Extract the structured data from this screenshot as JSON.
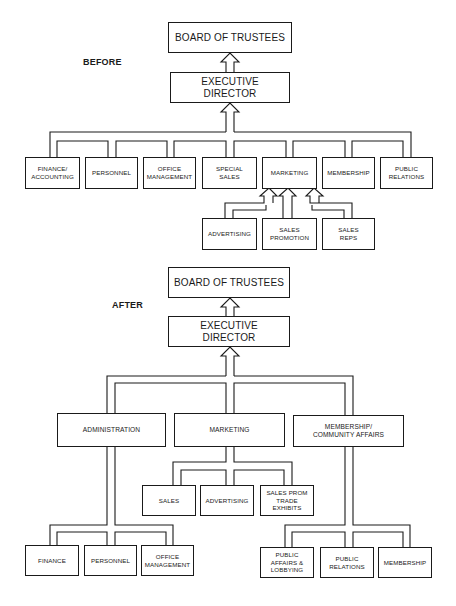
{
  "before": {
    "label": "BEFORE",
    "board": "BOARD OF TRUSTEES",
    "executive": "EXECUTIVE\nDIRECTOR",
    "departments": [
      "FINANCE/\nACCOUNTING",
      "PERSONNEL",
      "OFFICE\nMANAGEMENT",
      "SPECIAL\nSALES",
      "MARKETING",
      "MEMBERSHIP",
      "PUBLIC\nRELATIONS"
    ],
    "marketing_units": [
      "ADVERTISING",
      "SALES\nPROMOTION",
      "SALES\nREPS"
    ]
  },
  "after": {
    "label": "AFTER",
    "board": "BOARD OF TRUSTEES",
    "executive": "EXECUTIVE\nDIRECTOR",
    "divisions": [
      "ADMINISTRATION",
      "MARKETING",
      "MEMBERSHIP/\nCOMMUNITY AFFAIRS"
    ],
    "marketing_units": [
      "SALES",
      "ADVERTISING",
      "SALES PROM\nTRADE\nEXHIBITS"
    ],
    "administration_units": [
      "FINANCE",
      "PERSONNEL",
      "OFFICE\nMANAGEMENT"
    ],
    "membership_units": [
      "PUBLIC\nAFFAIRS &\nLOBBYING",
      "PUBLIC\nRELATIONS",
      "MEMBERSHIP"
    ]
  }
}
